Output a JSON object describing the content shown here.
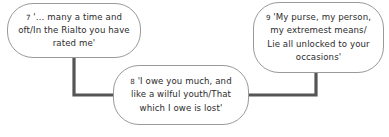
{
  "diagram": {
    "type": "flow-diagram",
    "background_color": "#ffffff",
    "node_border_color": "#9a9a9a",
    "node_fill_color": "#ffffff",
    "connector_color": "#555555",
    "text_color": "#2b2b2b",
    "nodes": [
      {
        "id": "node-7",
        "number": "7",
        "text": "'… many a time and oft/In the Rialto you have rated me'",
        "lines": [
          "'… many a time and",
          "oft/In the Rialto you",
          "have rated me'"
        ],
        "x": 7,
        "y": 3,
        "width": 134,
        "height": 55
      },
      {
        "id": "node-8",
        "number": "8",
        "text": "'I owe you much, and like a wilful youth/That which I owe is lost'",
        "lines": [
          "'I owe you much, and",
          "like a wilful youth/That",
          "which I owe is lost'"
        ],
        "x": 113,
        "y": 65,
        "width": 136,
        "height": 60
      },
      {
        "id": "node-9",
        "number": "9",
        "text": "'My purse, my person, my extremest means/ Lie all unlocked to your occasions'",
        "lines": [
          "'My purse, my person,",
          "my extremest means/",
          "Lie all unlocked to your",
          "occasions'"
        ],
        "x": 253,
        "y": 2,
        "width": 131,
        "height": 71
      }
    ],
    "connectors": [
      {
        "id": "connector-7-8",
        "from": "node-7",
        "to": "node-8",
        "path": "M 74 57 L 74 95 L 114 95"
      },
      {
        "id": "connector-9-8",
        "from": "node-9",
        "to": "node-8",
        "path": "M 316 72 L 316 95 L 248 95"
      }
    ]
  }
}
